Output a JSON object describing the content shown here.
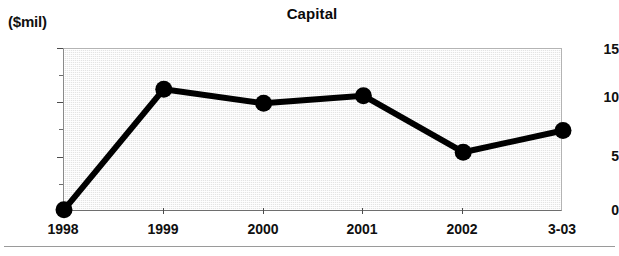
{
  "chart_data": {
    "type": "line",
    "title": "Capital",
    "xlabel": "",
    "ylabel": "($mil)",
    "categories": [
      "1998",
      "1999",
      "2000",
      "2001",
      "2002",
      "3-03"
    ],
    "values": [
      0.2,
      11.3,
      10.0,
      10.7,
      5.5,
      7.5
    ],
    "series": [
      {
        "name": "Capital",
        "values": [
          0.2,
          11.3,
          10.0,
          10.7,
          5.5,
          7.5
        ]
      }
    ],
    "ylim": [
      0,
      15
    ],
    "yticks": [
      0,
      5,
      10,
      15
    ],
    "ytick_labels": [
      "0",
      "5",
      "10",
      "15"
    ],
    "yminor_ticks": [
      2.5,
      7.5,
      12.5
    ],
    "grid": false,
    "legend": "none",
    "marker": "filled-circle",
    "line_color": "#000000",
    "marker_color": "#000000",
    "plot_background": "#e4e4e4"
  },
  "axis": {
    "y_unit_caption": "($mil)",
    "y_labels": [
      "15",
      "10",
      "5",
      "0"
    ],
    "x_labels": [
      "1998",
      "1999",
      "2000",
      "2001",
      "2002",
      "3-03"
    ]
  },
  "title": {
    "text": "Capital"
  }
}
